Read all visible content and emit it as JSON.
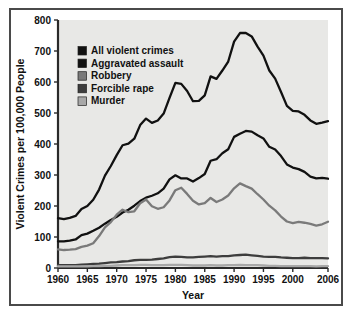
{
  "chart_data": {
    "type": "line",
    "title": "",
    "xlabel": "Year",
    "ylabel": "Violent Crimes per 100,000 People",
    "xlim": [
      1960,
      2006
    ],
    "ylim": [
      0,
      800
    ],
    "yticks": [
      0,
      100,
      200,
      300,
      400,
      500,
      600,
      700,
      800
    ],
    "xticks": [
      1960,
      1965,
      1970,
      1975,
      1980,
      1985,
      1990,
      1995,
      2000,
      2006
    ],
    "grid": false,
    "legend_position": "top-left",
    "background": "#e8e8e6",
    "frame_color": "#4a4a4a",
    "series": [
      {
        "name": "All violent crimes",
        "color": "#111111",
        "x": [
          1960,
          1961,
          1962,
          1963,
          1964,
          1965,
          1966,
          1967,
          1968,
          1969,
          1970,
          1971,
          1972,
          1973,
          1974,
          1975,
          1976,
          1977,
          1978,
          1979,
          1980,
          1981,
          1982,
          1983,
          1984,
          1985,
          1986,
          1987,
          1988,
          1989,
          1990,
          1991,
          1992,
          1993,
          1994,
          1995,
          1996,
          1997,
          1998,
          1999,
          2000,
          2001,
          2002,
          2003,
          2004,
          2005,
          2006
        ],
        "values": [
          161,
          158,
          162,
          168,
          190,
          200,
          220,
          253,
          298,
          329,
          364,
          396,
          401,
          417,
          461,
          482,
          468,
          476,
          498,
          549,
          597,
          594,
          571,
          538,
          539,
          557,
          618,
          610,
          637,
          666,
          730,
          758,
          758,
          747,
          714,
          685,
          637,
          611,
          568,
          523,
          507,
          505,
          494,
          476,
          465,
          469,
          474
        ]
      },
      {
        "name": "Aggravated assault",
        "color": "#111111",
        "x": [
          1960,
          1961,
          1962,
          1963,
          1964,
          1965,
          1966,
          1967,
          1968,
          1969,
          1970,
          1971,
          1972,
          1973,
          1974,
          1975,
          1976,
          1977,
          1978,
          1979,
          1980,
          1981,
          1982,
          1983,
          1984,
          1985,
          1986,
          1987,
          1988,
          1989,
          1990,
          1991,
          1992,
          1993,
          1994,
          1995,
          1996,
          1997,
          1998,
          1999,
          2000,
          2001,
          2002,
          2003,
          2004,
          2005,
          2006
        ],
        "values": [
          86,
          86,
          88,
          92,
          106,
          111,
          120,
          130,
          143,
          155,
          165,
          179,
          188,
          201,
          216,
          227,
          233,
          241,
          256,
          286,
          299,
          289,
          289,
          279,
          290,
          303,
          346,
          351,
          370,
          383,
          423,
          433,
          442,
          440,
          428,
          418,
          391,
          382,
          361,
          334,
          324,
          319,
          310,
          295,
          289,
          291,
          288
        ]
      },
      {
        "name": "Robbery",
        "color": "#7a7a7a",
        "x": [
          1960,
          1961,
          1962,
          1963,
          1964,
          1965,
          1966,
          1967,
          1968,
          1969,
          1970,
          1971,
          1972,
          1973,
          1974,
          1975,
          1976,
          1977,
          1978,
          1979,
          1980,
          1981,
          1982,
          1983,
          1984,
          1985,
          1986,
          1987,
          1988,
          1989,
          1990,
          1991,
          1992,
          1993,
          1994,
          1995,
          1996,
          1997,
          1998,
          1999,
          2000,
          2001,
          2002,
          2003,
          2004,
          2005,
          2006
        ],
        "values": [
          60,
          58,
          59,
          61,
          68,
          72,
          80,
          103,
          131,
          148,
          172,
          188,
          180,
          183,
          209,
          221,
          199,
          191,
          196,
          218,
          251,
          259,
          239,
          217,
          205,
          209,
          226,
          213,
          221,
          234,
          257,
          273,
          264,
          256,
          238,
          221,
          201,
          186,
          166,
          150,
          145,
          149,
          146,
          142,
          137,
          141,
          149
        ]
      },
      {
        "name": "Forcible rape",
        "color": "#3d3d3d",
        "x": [
          1960,
          1961,
          1962,
          1963,
          1964,
          1965,
          1966,
          1967,
          1968,
          1969,
          1970,
          1971,
          1972,
          1973,
          1974,
          1975,
          1976,
          1977,
          1978,
          1979,
          1980,
          1981,
          1982,
          1983,
          1984,
          1985,
          1986,
          1987,
          1988,
          1989,
          1990,
          1991,
          1992,
          1993,
          1994,
          1995,
          1996,
          1997,
          1998,
          1999,
          2000,
          2001,
          2002,
          2003,
          2004,
          2005,
          2006
        ],
        "values": [
          9,
          9,
          9,
          9,
          11,
          12,
          13,
          14,
          16,
          18,
          19,
          21,
          22,
          25,
          26,
          26,
          27,
          29,
          31,
          35,
          37,
          36,
          34,
          34,
          36,
          37,
          38,
          37,
          38,
          38,
          41,
          42,
          43,
          41,
          39,
          37,
          36,
          36,
          34,
          33,
          32,
          32,
          33,
          32,
          32,
          32,
          31
        ]
      },
      {
        "name": "Murder",
        "color": "#a8a8a8",
        "x": [
          1960,
          1961,
          1962,
          1963,
          1964,
          1965,
          1966,
          1967,
          1968,
          1969,
          1970,
          1971,
          1972,
          1973,
          1974,
          1975,
          1976,
          1977,
          1978,
          1979,
          1980,
          1981,
          1982,
          1983,
          1984,
          1985,
          1986,
          1987,
          1988,
          1989,
          1990,
          1991,
          1992,
          1993,
          1994,
          1995,
          1996,
          1997,
          1998,
          1999,
          2000,
          2001,
          2002,
          2003,
          2004,
          2005,
          2006
        ],
        "values": [
          5,
          5,
          5,
          5,
          5,
          5,
          6,
          6,
          7,
          7,
          8,
          9,
          9,
          9,
          10,
          10,
          9,
          9,
          9,
          10,
          10,
          10,
          9,
          8,
          8,
          8,
          9,
          8,
          8,
          9,
          9,
          10,
          9,
          9,
          9,
          8,
          7,
          7,
          6,
          6,
          6,
          6,
          6,
          6,
          5,
          6,
          6
        ]
      }
    ],
    "legend": [
      {
        "label": "All violent crimes",
        "color": "#111111"
      },
      {
        "label": "Aggravated assault",
        "color": "#111111"
      },
      {
        "label": "Robbery",
        "color": "#7a7a7a"
      },
      {
        "label": "Forcible rape",
        "color": "#3d3d3d"
      },
      {
        "label": "Murder",
        "color": "#a8a8a8"
      }
    ]
  }
}
